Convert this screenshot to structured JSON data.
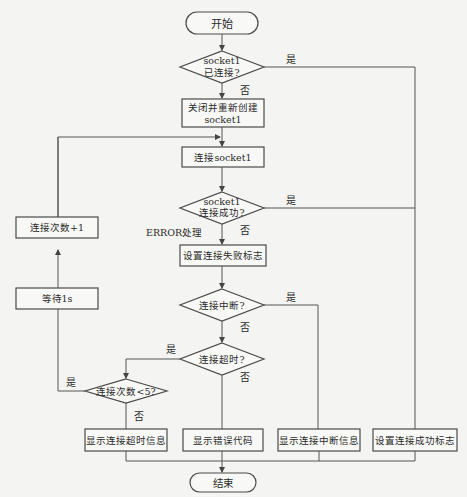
{
  "flowchart": {
    "start": "开始",
    "end": "结束",
    "decision_connected": {
      "line1": "socket1",
      "line2": "已连接?"
    },
    "box_recreate": {
      "line1": "关闭并重新创建",
      "line2": "socket1"
    },
    "box_connect": "连接socket1",
    "decision_success": {
      "line1": "socket1",
      "line2": "连接成功?"
    },
    "error_label": "ERROR处理",
    "box_set_fail": "设置连接失败标志",
    "decision_interrupt": "连接中断?",
    "decision_timeout": "连接超时?",
    "decision_count": "连接次数<5?",
    "box_increment": "连接次数+1",
    "box_wait": "等待1s",
    "box_show_timeout": "显示连接超时信息",
    "box_show_error": "显示错误代码",
    "box_show_interrupt": "显示连接中断信息",
    "box_set_success": "设置连接成功标志",
    "yes": "是",
    "no": "否"
  }
}
